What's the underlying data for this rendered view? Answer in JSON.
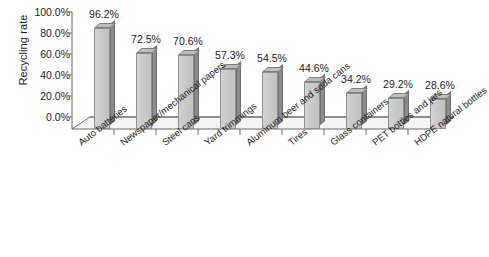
{
  "chart_data": {
    "type": "bar",
    "title": "",
    "xlabel": "",
    "ylabel": "Recycling rate",
    "ylim": [
      0,
      100
    ],
    "grid": false,
    "legend": "none",
    "ytick_labels": [
      "100.0%",
      "80.0%",
      "60.0%",
      "40.0%",
      "20.0%",
      "0.0%"
    ],
    "ytick_values": [
      100,
      80,
      60,
      40,
      20,
      0
    ],
    "categories": [
      "Auto batteries",
      "Newspaper/mechanical papers",
      "Steel cans",
      "Yard trimmings",
      "Aluminum beer and soda cans",
      "Tires",
      "Glass containers",
      "PET bottles and jars",
      "HDPE natural bottles"
    ],
    "values": [
      96.2,
      72.5,
      70.6,
      57.3,
      54.5,
      44.6,
      34.2,
      29.2,
      28.6
    ],
    "data_labels": [
      "96.2%",
      "72.5%",
      "70.6%",
      "57.3%",
      "54.5%",
      "44.6%",
      "34.2%",
      "29.2%",
      "28.6%"
    ],
    "colors": {
      "bar_front": "#c9c9c9",
      "bar_side": "#8c8c8c",
      "bar_top": "#bdbdbd",
      "bar_outline": "#8f8f8f",
      "axis": "#6b6b6b",
      "floor": "#f2f2f2",
      "text": "#1c1c1c",
      "background": "#ffffff"
    }
  }
}
